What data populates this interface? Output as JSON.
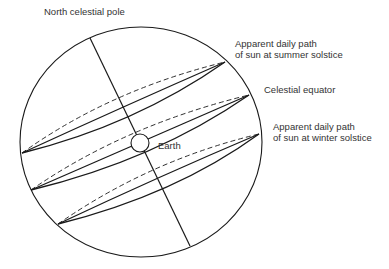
{
  "diagram": {
    "labels": {
      "north_pole": "North celestial pole",
      "summer_line1": "Apparent daily path",
      "summer_line2": "of sun at summer solstice",
      "equator": "Celestial equator",
      "earth": "Earth",
      "winter_line1": "Apparent daily path",
      "winter_line2": "of sun at winter solstice"
    },
    "colors": {
      "line": "#1a1a1a",
      "text": "#333333",
      "background": "#ffffff"
    }
  }
}
